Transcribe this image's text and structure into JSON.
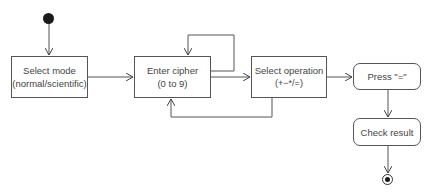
{
  "diagram": {
    "type": "activity",
    "nodes": {
      "start": {
        "kind": "initial"
      },
      "select_mode": {
        "label": "Select mode",
        "sublabel": "(normal/scientific)"
      },
      "enter_cipher": {
        "label": "Enter cipher",
        "sublabel": "(0 to 9)"
      },
      "select_operation": {
        "label": "Select operation",
        "sublabel": "(+−*/=)"
      },
      "press_equals": {
        "label": "Press \"=\""
      },
      "check_result": {
        "label": "Check result"
      },
      "end": {
        "kind": "final"
      }
    },
    "edges": [
      {
        "from": "start",
        "to": "select_mode"
      },
      {
        "from": "select_mode",
        "to": "enter_cipher"
      },
      {
        "from": "enter_cipher",
        "to": "enter_cipher"
      },
      {
        "from": "enter_cipher",
        "to": "select_operation"
      },
      {
        "from": "select_operation",
        "to": "enter_cipher"
      },
      {
        "from": "select_operation",
        "to": "press_equals"
      },
      {
        "from": "press_equals",
        "to": "check_result"
      },
      {
        "from": "check_result",
        "to": "end"
      }
    ],
    "colors": {
      "line": "#555555",
      "text": "#444444",
      "fill": "#ffffff"
    }
  }
}
